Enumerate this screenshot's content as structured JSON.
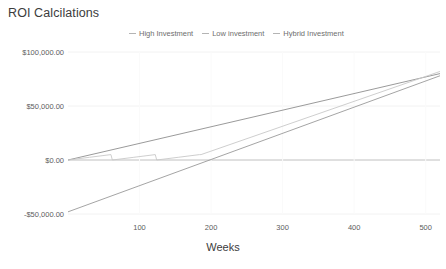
{
  "chart_data": {
    "type": "line",
    "title": "ROI Calcilations",
    "xlabel": "Weeks",
    "ylabel": "",
    "xlim": [
      0,
      520
    ],
    "ylim": [
      -60000,
      100000
    ],
    "grid": true,
    "legend_position": "top",
    "x_ticks": [
      100,
      200,
      300,
      400,
      500
    ],
    "x_tick_labels": [
      "100",
      "200",
      "300",
      "400",
      "500"
    ],
    "y_ticks": [
      100000,
      50000,
      0,
      -50000
    ],
    "y_tick_labels": [
      "$100,000.00",
      "$50,000.00",
      "$0.00",
      "-$50,000.00"
    ],
    "series": [
      {
        "name": "High Investment",
        "color": "#8f8f8f",
        "x": [
          0,
          520
        ],
        "values": [
          0,
          80000
        ]
      },
      {
        "name": "Low investment",
        "color": "#9a9a9a",
        "x": [
          0,
          520
        ],
        "values": [
          -48000,
          78000
        ]
      },
      {
        "name": "Hybrid Investment",
        "color": "#c8c8c8",
        "x": [
          0,
          30,
          60,
          62,
          92,
          122,
          124,
          154,
          184,
          186,
          520
        ],
        "values": [
          0,
          2500,
          5000,
          0,
          2500,
          5000,
          0,
          2500,
          5000,
          5000,
          82000
        ],
        "note": "sawtooth reinvestment pattern over first ~185 weeks, then linear growth"
      }
    ]
  },
  "legend": {
    "entries": [
      {
        "label": "High Investment"
      },
      {
        "label": "Low investment"
      },
      {
        "label": "Hybrid Investment"
      }
    ]
  }
}
